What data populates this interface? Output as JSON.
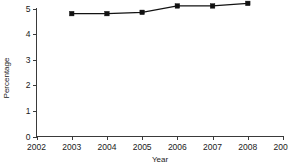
{
  "chart_data": {
    "type": "line",
    "title": "",
    "xlabel": "Year",
    "ylabel": "Percentage",
    "x": [
      2003,
      2004,
      2005,
      2006,
      2007,
      2008
    ],
    "values": [
      4.8,
      4.8,
      4.85,
      5.1,
      5.1,
      5.2
    ],
    "series": [
      {
        "name": "Percentage",
        "values": [
          4.8,
          4.8,
          4.85,
          5.1,
          5.1,
          5.2
        ]
      }
    ],
    "xlim": [
      2002,
      2009
    ],
    "ylim": [
      0,
      5
    ],
    "xticks": [
      2002,
      2003,
      2004,
      2005,
      2006,
      2007,
      2008,
      2009
    ],
    "yticks": [
      0,
      1,
      2,
      3,
      4,
      5
    ],
    "xtick_labels": [
      "2002",
      "2003",
      "2004",
      "2005",
      "2006",
      "2007",
      "2008",
      "2009"
    ],
    "ytick_labels": [
      "0",
      "1",
      "2",
      "3",
      "4",
      "5"
    ],
    "grid": false,
    "legend": null,
    "marker": "square",
    "line_color": "#111111",
    "marker_color": "#111111",
    "axis_color": "#3a3a3a",
    "background": "#ffffff"
  },
  "axes": {
    "y_title": "Percentage",
    "x_title": "Year"
  }
}
